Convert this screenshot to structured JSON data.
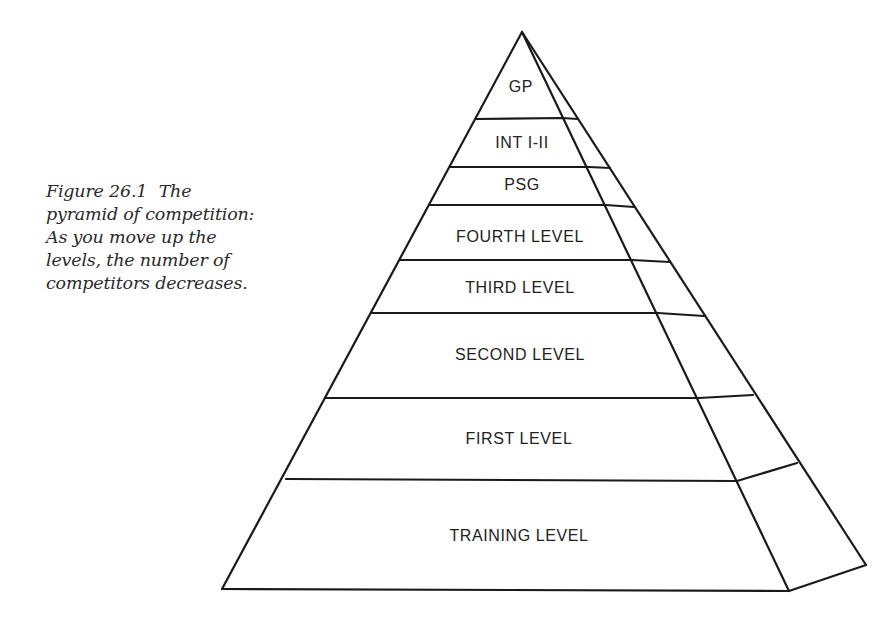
{
  "caption": {
    "figure_number": "Figure 26.1",
    "text": "The pyramid of competition: As you move up the levels, the number of competitors decreases."
  },
  "pyramid": {
    "levels": [
      {
        "label": "GP",
        "center_y": 88
      },
      {
        "label": "INT I-II",
        "center_y": 144
      },
      {
        "label": "PSG",
        "center_y": 186
      },
      {
        "label": "FOURTH LEVEL",
        "center_y": 238
      },
      {
        "label": "THIRD LEVEL",
        "center_y": 289
      },
      {
        "label": "SECOND LEVEL",
        "center_y": 356
      },
      {
        "label": "FIRST LEVEL",
        "center_y": 440
      },
      {
        "label": "TRAINING LEVEL",
        "center_y": 537
      }
    ],
    "stroke_color": "#1a1a1a",
    "text_color": "#222222"
  }
}
